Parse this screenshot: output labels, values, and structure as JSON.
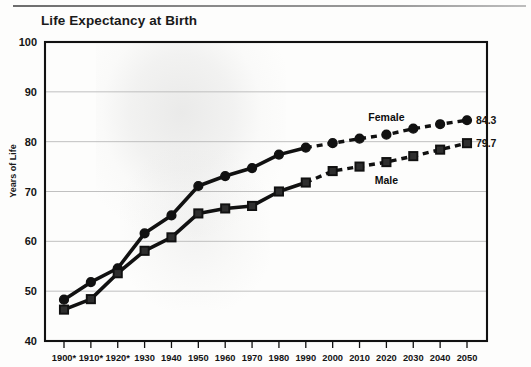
{
  "chart_data": {
    "type": "line",
    "title": "Life Expectancy at Birth",
    "xlabel": "",
    "ylabel": "Years of Life",
    "ylim": [
      40,
      100
    ],
    "yticks": [
      40,
      50,
      60,
      70,
      80,
      90,
      100
    ],
    "grid": true,
    "legend_position": "inline-annotation",
    "categories": [
      "1900*",
      "1910*",
      "1920*",
      "1930",
      "1940",
      "1950",
      "1960",
      "1970",
      "1980",
      "1990",
      "2000",
      "2010",
      "2020",
      "2030",
      "2040",
      "2050"
    ],
    "x": [
      1900,
      1910,
      1920,
      1930,
      1940,
      1950,
      1960,
      1970,
      1980,
      1990,
      2000,
      2010,
      2020,
      2030,
      2040,
      2050
    ],
    "series": [
      {
        "name": "Female",
        "marker": "circle",
        "values": [
          48.3,
          51.8,
          54.6,
          61.6,
          65.2,
          71.1,
          73.1,
          74.7,
          77.4,
          78.8,
          79.7,
          80.6,
          81.4,
          82.6,
          83.5,
          84.3
        ],
        "solid_through": 1990,
        "end_value_label": "84.3"
      },
      {
        "name": "Male",
        "marker": "square",
        "values": [
          46.3,
          48.4,
          53.6,
          58.1,
          60.8,
          65.6,
          66.6,
          67.1,
          70.0,
          71.8,
          74.1,
          75.0,
          75.9,
          77.1,
          78.4,
          79.7
        ],
        "solid_through": 1990,
        "end_value_label": "79.7"
      }
    ],
    "annotations": [
      {
        "text": "Female",
        "series": "Female"
      },
      {
        "text": "Male",
        "series": "Male"
      }
    ],
    "footnote_marker": "*",
    "end_value_labels": [
      "84.3",
      "79.7"
    ]
  },
  "colors": {
    "line": "#111111",
    "grid": "#b9b9b9",
    "axis": "#111111",
    "background": "#ffffff"
  }
}
